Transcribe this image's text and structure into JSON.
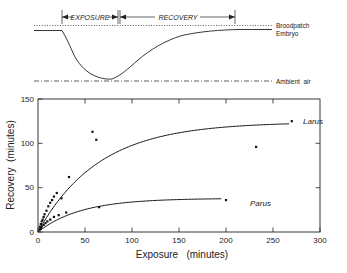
{
  "figure": {
    "top_panel": {
      "brackets": [
        {
          "label": "EXPOSURE",
          "x_start": 62,
          "x_end": 118
        },
        {
          "label": "RECOVERY",
          "x_start": 118,
          "x_end": 235
        }
      ],
      "traces": [
        {
          "name": "Broodpatch",
          "label": "Broodpatch",
          "style": "dotted"
        },
        {
          "name": "Embryo",
          "label": "Embryo",
          "style": "solid"
        },
        {
          "name": "Ambient air",
          "label": "Ambient  air",
          "style": "dash-dot"
        }
      ]
    }
  },
  "chart_data": {
    "type": "scatter",
    "title": "",
    "xlabel": "Exposure   (minutes)",
    "ylabel": "Recovery  (minutes)",
    "xlim": [
      0,
      300
    ],
    "ylim": [
      0,
      150
    ],
    "xticks": [
      0,
      50,
      100,
      150,
      200,
      250,
      300
    ],
    "yticks": [
      0,
      50,
      100,
      150
    ],
    "grid": false,
    "legend": "inline-curve-labels",
    "series": [
      {
        "name": "Larus",
        "label": "Larus",
        "marker": "square",
        "points": [
          [
            2,
            6
          ],
          [
            3,
            9
          ],
          [
            4,
            12
          ],
          [
            5,
            14
          ],
          [
            6,
            17
          ],
          [
            7,
            20
          ],
          [
            9,
            24
          ],
          [
            11,
            29
          ],
          [
            13,
            33
          ],
          [
            15,
            36
          ],
          [
            17,
            40
          ],
          [
            20,
            44
          ],
          [
            25,
            38
          ],
          [
            33,
            62
          ],
          [
            58,
            113
          ],
          [
            62,
            104
          ],
          [
            232,
            96
          ],
          [
            270,
            125
          ]
        ],
        "fit_curve": {
          "model": "asymptotic",
          "asymptote": 124,
          "rate_constant": 0.0155,
          "description": "y = 124 * (1 - exp(-0.0155 x))"
        }
      },
      {
        "name": "Parus",
        "label": "Parus",
        "marker": "square",
        "points": [
          [
            2,
            3
          ],
          [
            3,
            4
          ],
          [
            4,
            6
          ],
          [
            6,
            8
          ],
          [
            8,
            10
          ],
          [
            10,
            12
          ],
          [
            13,
            14
          ],
          [
            17,
            17
          ],
          [
            22,
            19
          ],
          [
            30,
            22
          ],
          [
            65,
            28
          ],
          [
            200,
            36
          ]
        ],
        "fit_curve": {
          "model": "asymptotic",
          "asymptote": 38,
          "rate_constant": 0.022,
          "description": "y = 38 * (1 - exp(-0.022 x))"
        }
      }
    ]
  }
}
